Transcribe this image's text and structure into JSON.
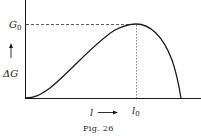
{
  "figure": {
    "caption": "Fig. 26",
    "y_axis_label": "ΔG",
    "x_axis_label": "l",
    "peak_value_label": "G",
    "peak_value_subscript": "0",
    "peak_position_label": "l",
    "peak_position_subscript": "0",
    "curve": "rises from origin to maximum G0 at l0, then falls steeply to zero"
  }
}
